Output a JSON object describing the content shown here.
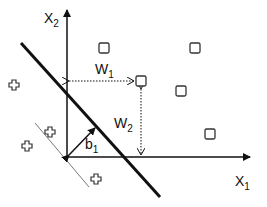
{
  "diagram": {
    "axes": {
      "x_label": "X",
      "x_sub": "1",
      "y_label": "X",
      "y_sub": "2"
    },
    "annotations": {
      "w1_label": "W",
      "w1_sub": "1",
      "w2_label": "W",
      "w2_sub": "2",
      "b1_label": "b",
      "b1_sub": "1"
    },
    "class_square_points": [
      {
        "x": 104,
        "y": 48
      },
      {
        "x": 195,
        "y": 48
      },
      {
        "x": 141,
        "y": 81
      },
      {
        "x": 181,
        "y": 91
      },
      {
        "x": 210,
        "y": 134
      }
    ],
    "class_cross_points": [
      {
        "x": 14,
        "y": 85
      },
      {
        "x": 50,
        "y": 132
      },
      {
        "x": 27,
        "y": 146
      },
      {
        "x": 96,
        "y": 179
      }
    ],
    "colors": {
      "stroke": "#111111",
      "thin_line": "#555555",
      "background": "#ffffff"
    }
  }
}
